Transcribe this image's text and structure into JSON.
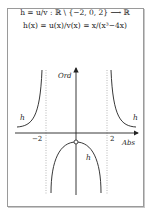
{
  "formula": {
    "line1": "h = u/v : ℝ \\ {−2, 0, 2} ⟶ ℝ",
    "line2": "h(x) = u(x)/v(x) = x/(x³−4x)"
  },
  "graph": {
    "y_axis_label": "Ord",
    "x_axis_label": "Abs",
    "tick_neg": "−2",
    "tick_pos": "2",
    "curve_label": "h",
    "colors": {
      "curve": "#222222",
      "axis": "#222222",
      "asymptote": "#999999"
    }
  }
}
